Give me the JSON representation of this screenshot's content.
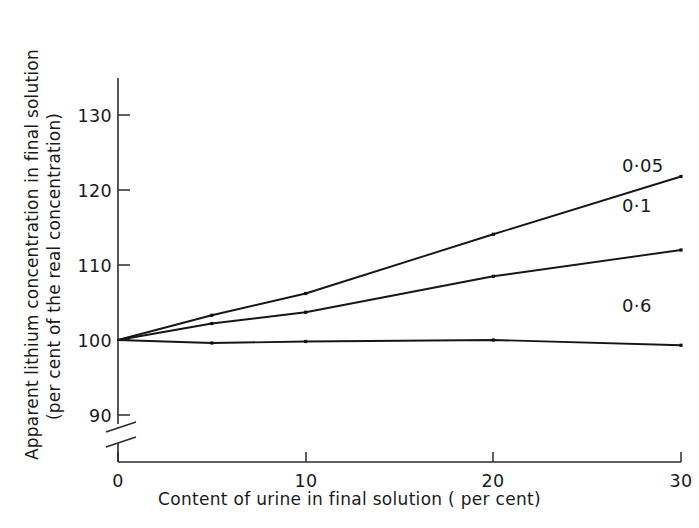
{
  "chart_data": {
    "type": "line",
    "title": "",
    "xlabel": "Content of urine in final solution ( per cent)",
    "ylabel_line1": "Apparent lithium concentration in final solution",
    "ylabel_line2": "(per cent of the real concentration)",
    "x": [
      0,
      5,
      10,
      20,
      30
    ],
    "xlim": [
      0,
      30
    ],
    "ylim": [
      88,
      134
    ],
    "xticks": [
      0,
      10,
      20,
      30
    ],
    "xtick_labels": [
      "0",
      "10",
      "20",
      "30"
    ],
    "yticks": [
      90,
      100,
      110,
      120,
      130
    ],
    "ytick_labels": [
      "90",
      "100",
      "110",
      "120",
      "130"
    ],
    "y_axis_break": true,
    "y_axis_break_note": "axis broken between 0 and 90",
    "grid": false,
    "legend_position": "inline-right-of-line-ends",
    "series": [
      {
        "name": "0·05",
        "label": "0·05",
        "values": [
          100,
          103.3,
          106.2,
          114.1,
          121.8
        ],
        "color": "#161616"
      },
      {
        "name": "0·1",
        "label": "0·1",
        "values": [
          100,
          102.2,
          103.7,
          108.5,
          112.0
        ],
        "color": "#161616"
      },
      {
        "name": "0·6",
        "label": "0·6",
        "values": [
          100,
          99.6,
          99.8,
          100.0,
          99.3
        ],
        "color": "#161616"
      }
    ]
  },
  "axis": {
    "ytick_0": "130",
    "ytick_1": "120",
    "ytick_2": "110",
    "ytick_3": "100",
    "ytick_4": "90",
    "xtick_0": "0",
    "xtick_1": "10",
    "xtick_2": "20",
    "xtick_3": "30"
  },
  "series_labels": {
    "s0": "0·05",
    "s1": "0·1",
    "s2": "0·6"
  },
  "titles": {
    "xlabel": "Content of urine in final solution ( per cent)",
    "ylabel_line1": "Apparent lithium concentration in final solution",
    "ylabel_line2": "(per cent of the real concentration)"
  },
  "colors": {
    "ink": "#1a1a1a",
    "line": "#161616",
    "background": "#ffffff"
  }
}
